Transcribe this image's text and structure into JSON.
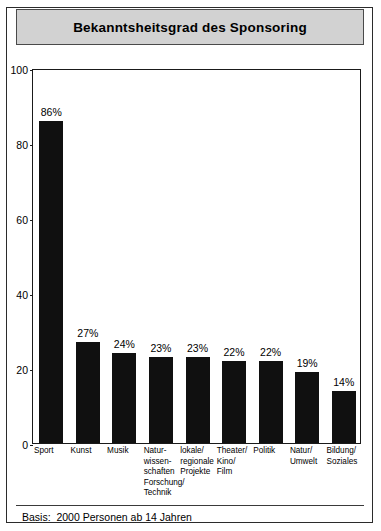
{
  "chart_data": {
    "type": "bar",
    "title": "Bekanntsheitsgrad des Sponsoring",
    "xlabel": "",
    "ylabel": "",
    "ylim": [
      0,
      100
    ],
    "yticks": [
      "0",
      "20",
      "40",
      "60",
      "80",
      "100"
    ],
    "grid": false,
    "legend": "none",
    "orientation": "vertical",
    "bar_color": "#101010",
    "categories": [
      "Sport",
      "Kunst",
      "Musik",
      "Natur-\nwissen-\nschaften\nForschung/\nTechnik",
      "lokale/\nregionale\nProjekte",
      "Theater/\nKino/\nFilm",
      "Politik",
      "Natur/\nUmwelt",
      "Bildung/\nSoziales"
    ],
    "values": [
      86,
      27,
      24,
      23,
      23,
      22,
      22,
      19,
      14
    ],
    "data_labels": [
      "86%",
      "27%",
      "24%",
      "23%",
      "23%",
      "22%",
      "22%",
      "19%",
      "14%"
    ],
    "annotations": [
      "Basis:  2000 Personen ab 14 Jahren"
    ]
  },
  "footer": {
    "basis": "Basis:  2000 Personen ab 14 Jahren"
  }
}
